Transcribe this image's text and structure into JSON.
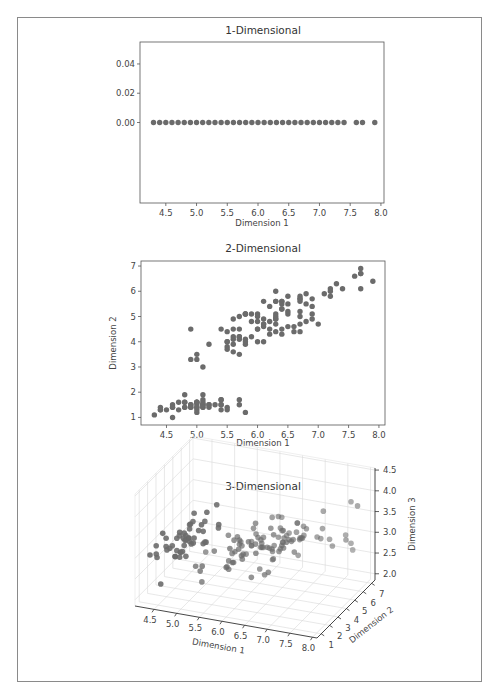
{
  "figure": {
    "panels": [
      "1-Dimensional",
      "2-Dimensional",
      "3-Dimensional"
    ]
  },
  "chart_data": [
    {
      "type": "scatter",
      "title": "1-Dimensional",
      "xlabel": "Dimension 1",
      "ylabel": "",
      "xticks": [
        4.5,
        5.0,
        5.5,
        6.0,
        6.5,
        7.0,
        7.5,
        8.0
      ],
      "xtick_labels": [
        "4.5",
        "5.0",
        "5.5",
        "6.0",
        "6.5",
        "7.0",
        "7.5",
        "8.0"
      ],
      "yticks": [
        0.0,
        0.02,
        0.04
      ],
      "ytick_labels": [
        "0.00",
        "0.02",
        "0.04"
      ],
      "xlim": [
        4.08,
        8.05
      ],
      "ylim": [
        -0.055,
        0.055
      ],
      "grid": false,
      "color": "#6b6b6b",
      "x": [
        4.3,
        4.4,
        4.5,
        4.6,
        4.7,
        4.8,
        4.9,
        5.0,
        5.1,
        5.2,
        5.3,
        5.4,
        5.5,
        5.6,
        5.7,
        5.8,
        5.9,
        6.0,
        6.1,
        6.2,
        6.3,
        6.4,
        6.5,
        6.6,
        6.7,
        6.8,
        6.9,
        7.0,
        7.1,
        7.2,
        7.3,
        7.4,
        7.6,
        7.7,
        7.9
      ],
      "y_constant": 0.0
    },
    {
      "type": "scatter",
      "title": "2-Dimensional",
      "xlabel": "Dimension 1",
      "ylabel": "Dimension 2",
      "xticks": [
        4.5,
        5.0,
        5.5,
        6.0,
        6.5,
        7.0,
        7.5,
        8.0
      ],
      "xtick_labels": [
        "4.5",
        "5.0",
        "5.5",
        "6.0",
        "6.5",
        "7.0",
        "7.5",
        "8.0"
      ],
      "yticks": [
        1,
        2,
        3,
        4,
        5,
        6,
        7
      ],
      "ytick_labels": [
        "1",
        "2",
        "3",
        "4",
        "5",
        "6",
        "7"
      ],
      "xlim": [
        4.08,
        8.1
      ],
      "ylim": [
        0.7,
        7.2
      ],
      "grid": false,
      "color": "#6b6b6b",
      "points": [
        [
          5.1,
          1.4
        ],
        [
          4.9,
          1.4
        ],
        [
          4.7,
          1.3
        ],
        [
          4.6,
          1.5
        ],
        [
          5.0,
          1.4
        ],
        [
          5.4,
          1.7
        ],
        [
          4.6,
          1.4
        ],
        [
          5.0,
          1.5
        ],
        [
          4.4,
          1.4
        ],
        [
          4.9,
          1.5
        ],
        [
          5.4,
          1.5
        ],
        [
          4.8,
          1.6
        ],
        [
          4.8,
          1.4
        ],
        [
          4.3,
          1.1
        ],
        [
          5.8,
          1.2
        ],
        [
          5.7,
          1.5
        ],
        [
          5.4,
          1.3
        ],
        [
          5.1,
          1.4
        ],
        [
          5.7,
          1.7
        ],
        [
          5.1,
          1.5
        ],
        [
          5.4,
          1.7
        ],
        [
          5.1,
          1.5
        ],
        [
          4.6,
          1.0
        ],
        [
          5.1,
          1.7
        ],
        [
          4.8,
          1.9
        ],
        [
          5.0,
          1.6
        ],
        [
          5.0,
          1.6
        ],
        [
          5.2,
          1.5
        ],
        [
          5.2,
          1.4
        ],
        [
          4.7,
          1.6
        ],
        [
          4.8,
          1.6
        ],
        [
          5.4,
          1.5
        ],
        [
          5.2,
          1.5
        ],
        [
          5.5,
          1.4
        ],
        [
          4.9,
          1.5
        ],
        [
          5.0,
          1.2
        ],
        [
          5.5,
          1.3
        ],
        [
          4.9,
          1.4
        ],
        [
          4.4,
          1.3
        ],
        [
          5.1,
          1.5
        ],
        [
          5.0,
          1.3
        ],
        [
          4.5,
          1.3
        ],
        [
          4.4,
          1.3
        ],
        [
          5.0,
          1.6
        ],
        [
          5.1,
          1.9
        ],
        [
          4.8,
          1.4
        ],
        [
          5.1,
          1.6
        ],
        [
          4.6,
          1.4
        ],
        [
          5.3,
          1.5
        ],
        [
          5.0,
          1.4
        ],
        [
          7.0,
          4.7
        ],
        [
          6.4,
          4.5
        ],
        [
          6.9,
          4.9
        ],
        [
          5.5,
          4.0
        ],
        [
          6.5,
          4.6
        ],
        [
          5.7,
          4.5
        ],
        [
          6.3,
          4.7
        ],
        [
          4.9,
          3.3
        ],
        [
          6.6,
          4.6
        ],
        [
          5.2,
          3.9
        ],
        [
          5.0,
          3.5
        ],
        [
          5.9,
          4.2
        ],
        [
          6.0,
          4.0
        ],
        [
          6.1,
          4.7
        ],
        [
          5.6,
          3.6
        ],
        [
          6.7,
          4.4
        ],
        [
          5.6,
          4.5
        ],
        [
          5.8,
          4.1
        ],
        [
          6.2,
          4.5
        ],
        [
          5.6,
          3.9
        ],
        [
          5.9,
          4.8
        ],
        [
          6.1,
          4.0
        ],
        [
          6.3,
          4.9
        ],
        [
          6.1,
          4.7
        ],
        [
          6.4,
          4.3
        ],
        [
          6.6,
          4.4
        ],
        [
          6.8,
          4.8
        ],
        [
          6.7,
          5.0
        ],
        [
          6.0,
          4.5
        ],
        [
          5.7,
          3.5
        ],
        [
          5.5,
          3.8
        ],
        [
          5.5,
          3.7
        ],
        [
          5.8,
          3.9
        ],
        [
          6.0,
          5.1
        ],
        [
          5.4,
          4.5
        ],
        [
          6.0,
          4.5
        ],
        [
          6.7,
          4.7
        ],
        [
          6.3,
          4.4
        ],
        [
          5.6,
          4.1
        ],
        [
          5.5,
          4.0
        ],
        [
          5.5,
          4.4
        ],
        [
          6.1,
          4.6
        ],
        [
          5.8,
          4.0
        ],
        [
          5.0,
          3.3
        ],
        [
          5.6,
          4.2
        ],
        [
          5.7,
          4.2
        ],
        [
          5.7,
          4.2
        ],
        [
          6.2,
          4.3
        ],
        [
          5.1,
          3.0
        ],
        [
          5.7,
          4.1
        ],
        [
          6.3,
          6.0
        ],
        [
          5.8,
          5.1
        ],
        [
          7.1,
          5.9
        ],
        [
          6.3,
          5.6
        ],
        [
          6.5,
          5.8
        ],
        [
          7.6,
          6.6
        ],
        [
          4.9,
          4.5
        ],
        [
          7.3,
          6.3
        ],
        [
          6.7,
          5.8
        ],
        [
          7.2,
          6.1
        ],
        [
          6.5,
          5.1
        ],
        [
          6.4,
          5.3
        ],
        [
          6.8,
          5.5
        ],
        [
          5.7,
          5.0
        ],
        [
          5.8,
          5.1
        ],
        [
          6.4,
          5.3
        ],
        [
          6.5,
          5.5
        ],
        [
          7.7,
          6.7
        ],
        [
          7.7,
          6.9
        ],
        [
          6.0,
          5.0
        ],
        [
          6.9,
          5.7
        ],
        [
          5.6,
          4.9
        ],
        [
          7.7,
          6.7
        ],
        [
          6.3,
          4.9
        ],
        [
          6.7,
          5.7
        ],
        [
          7.2,
          6.0
        ],
        [
          6.2,
          4.8
        ],
        [
          6.1,
          4.9
        ],
        [
          6.4,
          5.6
        ],
        [
          7.2,
          5.8
        ],
        [
          7.4,
          6.1
        ],
        [
          7.9,
          6.4
        ],
        [
          6.4,
          5.6
        ],
        [
          6.3,
          5.1
        ],
        [
          6.1,
          5.6
        ],
        [
          7.7,
          6.1
        ],
        [
          6.3,
          5.6
        ],
        [
          6.4,
          5.5
        ],
        [
          6.0,
          4.8
        ],
        [
          6.9,
          5.4
        ],
        [
          6.7,
          5.6
        ],
        [
          6.9,
          5.1
        ],
        [
          5.8,
          5.1
        ],
        [
          6.8,
          5.9
        ],
        [
          6.7,
          5.7
        ],
        [
          6.7,
          5.2
        ],
        [
          6.3,
          5.0
        ],
        [
          6.5,
          5.2
        ],
        [
          6.2,
          5.4
        ],
        [
          5.9,
          5.1
        ]
      ]
    },
    {
      "type": "scatter3d",
      "title": "3-Dimensional",
      "xlabel": "Dimension 1",
      "ylabel": "Dimension 2",
      "zlabel": "Dimension 3",
      "xticks": [
        4.5,
        5.0,
        5.5,
        6.0,
        6.5,
        7.0,
        7.5,
        8.0
      ],
      "xtick_labels": [
        "4.5",
        "5.0",
        "5.5",
        "6.0",
        "6.5",
        "7.0",
        "7.5",
        "8.0"
      ],
      "yticks": [
        1,
        2,
        3,
        4,
        5,
        6,
        7
      ],
      "ytick_labels": [
        "1",
        "2",
        "3",
        "4",
        "5",
        "6",
        "7"
      ],
      "zticks": [
        2.0,
        2.5,
        3.0,
        3.5,
        4.0,
        4.5
      ],
      "ztick_labels": [
        "2.0",
        "2.5",
        "3.0",
        "3.5",
        "4.0",
        "4.5"
      ],
      "xlim": [
        4.3,
        7.9
      ],
      "ylim": [
        1.0,
        6.9
      ],
      "zlim": [
        2.0,
        4.4
      ],
      "grid": true,
      "color": "#6b6b6b",
      "z_values": [
        3.5,
        3.0,
        3.2,
        3.1,
        3.6,
        3.9,
        3.4,
        3.4,
        2.9,
        3.1,
        3.7,
        3.4,
        3.0,
        3.0,
        4.0,
        4.4,
        3.9,
        3.5,
        3.8,
        3.8,
        3.4,
        3.7,
        3.6,
        3.3,
        3.4,
        3.0,
        3.4,
        3.5,
        3.4,
        3.2,
        3.1,
        3.4,
        4.1,
        4.2,
        3.1,
        3.2,
        3.5,
        3.6,
        3.0,
        3.4,
        3.5,
        2.3,
        3.2,
        3.5,
        3.8,
        3.0,
        3.8,
        3.2,
        3.7,
        3.3,
        3.2,
        3.2,
        3.1,
        2.3,
        2.8,
        2.8,
        3.3,
        2.4,
        2.9,
        2.7,
        2.0,
        3.0,
        2.2,
        2.9,
        2.9,
        3.1,
        3.0,
        2.7,
        2.2,
        2.5,
        3.2,
        2.8,
        2.5,
        2.8,
        2.9,
        3.0,
        2.8,
        3.0,
        2.9,
        2.6,
        2.4,
        2.4,
        2.7,
        2.7,
        3.0,
        3.4,
        3.1,
        2.3,
        3.0,
        2.5,
        2.6,
        3.0,
        2.6,
        2.3,
        2.7,
        3.0,
        2.9,
        2.9,
        2.5,
        2.8,
        3.3,
        2.7,
        3.0,
        2.9,
        3.0,
        3.0,
        2.5,
        2.9,
        2.5,
        3.6,
        3.2,
        2.7,
        3.0,
        2.5,
        2.8,
        3.2,
        3.0,
        3.8,
        2.6,
        2.2,
        3.2,
        2.8,
        2.8,
        2.7,
        3.3,
        3.2,
        2.8,
        3.0,
        2.8,
        3.0,
        2.8,
        3.8,
        2.8,
        2.8,
        2.6,
        3.0,
        3.4,
        3.1,
        3.0,
        3.1,
        3.1,
        3.1,
        2.7,
        3.2,
        3.3,
        3.0,
        2.5,
        3.0,
        3.4,
        3.0
      ],
      "note": "x and y values identical to the 2-Dimensional panel points (same order)"
    }
  ]
}
